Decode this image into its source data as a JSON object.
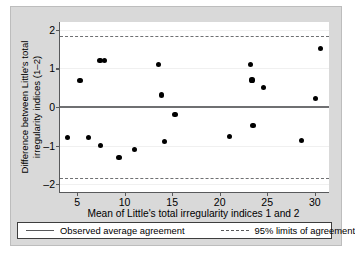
{
  "chart_data": {
    "type": "scatter",
    "title": "",
    "xlabel": "Mean of Little's total irregularity indices 1 and 2",
    "ylabel": "Difference between Little's total irregularity indices (1–2)",
    "xlim": [
      3.2,
      31.5
    ],
    "ylim": [
      -2.2,
      2.2
    ],
    "xticks": [
      5,
      10,
      15,
      20,
      25,
      30
    ],
    "yticks": [
      -2,
      -1,
      0,
      1,
      2
    ],
    "xtick_labels": [
      "5",
      "10",
      "15",
      "20",
      "25",
      "30"
    ],
    "ytick_labels": [
      "-2",
      "-1",
      "0",
      "1",
      "2"
    ],
    "grid": true,
    "legend_position": "below",
    "reference_lines": [
      {
        "name": "observed-average-agreement",
        "value": 0.02,
        "style": "solid"
      },
      {
        "name": "upper-limit-of-agreement",
        "value": 1.85,
        "style": "dashed"
      },
      {
        "name": "lower-limit-of-agreement",
        "value": -1.83,
        "style": "dashed"
      }
    ],
    "points": [
      {
        "x": 4.0,
        "y": -0.79
      },
      {
        "x": 5.3,
        "y": 0.69
      },
      {
        "x": 6.2,
        "y": -0.78
      },
      {
        "x": 7.4,
        "y": 1.2
      },
      {
        "x": 7.5,
        "y": -1.0
      },
      {
        "x": 7.9,
        "y": 1.2
      },
      {
        "x": 9.4,
        "y": -1.3
      },
      {
        "x": 11.0,
        "y": -1.09
      },
      {
        "x": 13.6,
        "y": 1.1
      },
      {
        "x": 13.9,
        "y": 0.31
      },
      {
        "x": 14.2,
        "y": -0.89
      },
      {
        "x": 15.3,
        "y": -0.19
      },
      {
        "x": 21.0,
        "y": -0.77
      },
      {
        "x": 23.2,
        "y": 1.11
      },
      {
        "x": 23.4,
        "y": 0.7
      },
      {
        "x": 23.5,
        "y": -0.47
      },
      {
        "x": 24.6,
        "y": 0.5
      },
      {
        "x": 28.6,
        "y": -0.87
      },
      {
        "x": 30.1,
        "y": 0.22
      },
      {
        "x": 30.6,
        "y": 1.52
      }
    ]
  },
  "legend": {
    "items": [
      {
        "label": "Observed average agreement",
        "style": "solid"
      },
      {
        "label": "95% limits of agreement",
        "style": "dashed"
      }
    ]
  },
  "colors": {
    "point": "#000000",
    "axis": "#58595b",
    "reference": "#6f7072",
    "grid": "#f0f0f0",
    "figure_background": "#d9d9d9",
    "plot_background": "#ffffff"
  }
}
